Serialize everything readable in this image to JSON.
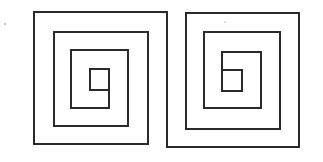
{
  "figure": {
    "stroke_color": "#2a2a2a",
    "background_color": "#ffffff",
    "stroke_width": 2,
    "spirals": [
      {
        "name": "left-spiral",
        "points": "109,90 90,90 90,69 109,69 109,108 71,108 71,50 128,50 128,126 54,126 54,32 148,32 148,144 34,144 34,12 167,12 167,147"
      },
      {
        "name": "right-spiral",
        "points": "167,147 299,147 299,13 186,13 186,129 280,129 280,32 204,32 204,108 261,108 261,52 222,52 222,91 242,91 242,70 222,70"
      }
    ],
    "specks": [
      {
        "cx": 5,
        "cy": 24,
        "r": 0.8
      },
      {
        "cx": 225,
        "cy": 22,
        "r": 0.6
      }
    ]
  }
}
